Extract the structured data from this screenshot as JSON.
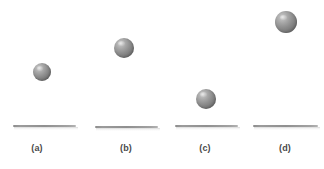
{
  "figure": {
    "background_color": "#ffffff",
    "width": 324,
    "height": 169,
    "ball_color_highlight": "#d2d2d2",
    "ball_color_mid": "#8e8e8e",
    "ball_color_shadow": "#6e6e6e",
    "surface_color": "#8f8f8f",
    "caption_color": "#4a4a4a"
  },
  "panels": [
    {
      "label": "(a)",
      "ball": {
        "center_x": 42,
        "center_y": 72,
        "diameter": 18
      },
      "surface": {
        "left": 13,
        "right": 76,
        "y": 125
      },
      "caption_center_x": 37
    },
    {
      "label": "(b)",
      "ball": {
        "center_x": 124,
        "center_y": 48,
        "diameter": 20
      },
      "surface": {
        "left": 95,
        "right": 158,
        "y": 126
      },
      "caption_center_x": 126
    },
    {
      "label": "(c)",
      "ball": {
        "center_x": 206,
        "center_y": 99,
        "diameter": 20
      },
      "surface": {
        "left": 175,
        "right": 238,
        "y": 125
      },
      "caption_center_x": 205
    },
    {
      "label": "(d)",
      "ball": {
        "center_x": 286,
        "center_y": 22,
        "diameter": 22
      },
      "surface": {
        "left": 253,
        "right": 318,
        "y": 125
      },
      "caption_center_x": 285
    }
  ]
}
